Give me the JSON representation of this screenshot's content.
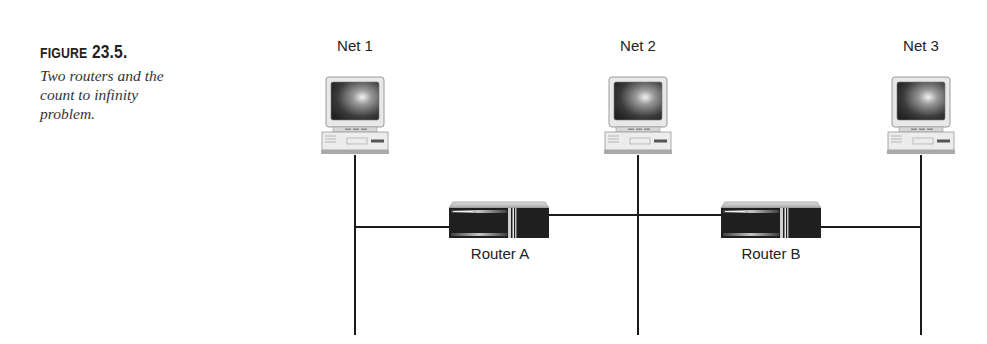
{
  "figure": {
    "number_word": "Figure",
    "number": "23.5.",
    "description_lines": [
      "Two routers and the",
      "count to infinity",
      "problem."
    ]
  },
  "networks": [
    {
      "id": "net1",
      "label": "Net 1",
      "x": 355
    },
    {
      "id": "net2",
      "label": "Net 2",
      "x": 638
    },
    {
      "id": "net3",
      "label": "Net 3",
      "x": 921
    }
  ],
  "routers": [
    {
      "id": "router-a",
      "label": "Router A",
      "x": 449,
      "connects": [
        "Net 1",
        "Net 2"
      ]
    },
    {
      "id": "router-b",
      "label": "Router B",
      "x": 721,
      "connects": [
        "Net 2",
        "Net 3"
      ]
    }
  ],
  "colors": {
    "line": "#1a1a1a",
    "router_body": "#1c1c1c",
    "router_top": "#c8c8c8",
    "monitor_shell": "#e6e6e6",
    "screen": "#555555"
  }
}
